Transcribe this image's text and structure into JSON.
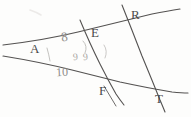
{
  "figure": {
    "kind": "hand-drawn-geometry-sketch",
    "media": "pencil on white paper",
    "width_px": 191,
    "height_px": 117,
    "background_color": "#fdfdfc",
    "ink_color": "#4a4a4a",
    "faint_ink_color": "#8e8c8a"
  },
  "point_labels": [
    {
      "name": "A",
      "text": "A",
      "x": 30,
      "y": 42
    },
    {
      "name": "E",
      "text": "E",
      "x": 91,
      "y": 26
    },
    {
      "name": "R",
      "text": "R",
      "x": 131,
      "y": 8
    },
    {
      "name": "F",
      "text": "F",
      "x": 99,
      "y": 84
    },
    {
      "name": "T",
      "text": "T",
      "x": 155,
      "y": 92
    }
  ],
  "annotations": {
    "measure_upper": "8",
    "measure_lower": "10",
    "angle_digit_left": "9",
    "angle_digit_right": "9",
    "angle_arc_near_e": "(",
    "angle_arc_right": "("
  },
  "strokes": {
    "line_A_to_R_upper": "transversal rising from left edge through A and E up to R and the right edge",
    "line_A_to_T_lower": "line falling from left edge through A down through F toward T",
    "line_E_F_descending": "steep line from top through E down past F to lower right",
    "line_R_T_descending": "steep line from top through R down to T",
    "line_bottom_right": "shallow line through F and T exiting right edge"
  }
}
